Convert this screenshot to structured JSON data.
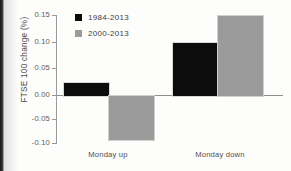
{
  "chart_data": {
    "type": "bar",
    "title": "",
    "xlabel": "",
    "ylabel": "FTSE 100 change (%)",
    "categories": [
      "Monday up",
      "Monday down"
    ],
    "series": [
      {
        "name": "1984-2013",
        "color": "#0c0c0c",
        "values": [
          0.025,
          0.1
        ]
      },
      {
        "name": "2000-2013",
        "color": "#9b9b9b",
        "values": [
          -0.083,
          0.15
        ]
      }
    ],
    "ylim": [
      -0.1,
      0.15
    ],
    "ytick_values": [
      0.15,
      0.1,
      0.05,
      0.0,
      -0.05,
      -0.1
    ],
    "ytick_labels": [
      "0.15",
      "0.10",
      "0.05",
      "0.00",
      "-0.05",
      "-0.10"
    ],
    "grid": false,
    "legend_position": "top-left",
    "zero_line": true
  },
  "axis": {
    "ylabel": "FTSE 100 change (%)",
    "ticks": [
      {
        "label": "0.15"
      },
      {
        "label": "0.10"
      },
      {
        "label": "0.05"
      },
      {
        "label": "0.00"
      },
      {
        "label": "-0.05"
      },
      {
        "label": "-0.10"
      }
    ]
  },
  "legend": {
    "entries": [
      {
        "label": "1984-2013",
        "swatch": "legend-swatch-black"
      },
      {
        "label": "2000-2013",
        "swatch": "legend-swatch-grey"
      }
    ]
  },
  "categories": [
    {
      "label": "Monday up"
    },
    {
      "label": "Monday down"
    }
  ]
}
